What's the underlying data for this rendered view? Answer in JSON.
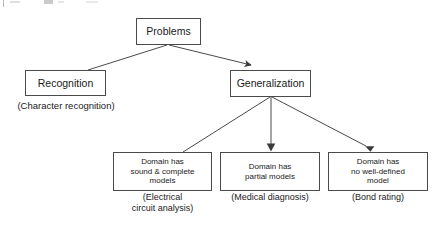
{
  "diagram": {
    "stroke_color": "#4a4a4a",
    "text_color": "#1a1a1a",
    "background_color": "#ffffff",
    "nodes": {
      "problems": {
        "label": "Problems"
      },
      "recognition": {
        "label": "Recognition"
      },
      "generalization": {
        "label": "Generalization"
      },
      "sound_complete": {
        "label": "Domain has\nsound & complete\nmodels"
      },
      "partial": {
        "label": "Domain has\npartial models"
      },
      "no_model": {
        "label": "Domain has\nno well-defined\nmodel"
      }
    },
    "captions": {
      "recognition": "(Character recognition)",
      "electrical": "(Electrical\ncircuit analysis)",
      "medical": "(Medical diagnosis)",
      "bond": "(Bond rating)"
    },
    "edges": [
      {
        "name": "problems-to-recognition",
        "from": "problems",
        "to": "recognition",
        "arrowhead": false
      },
      {
        "name": "problems-to-generalization",
        "from": "problems",
        "to": "generalization",
        "arrowhead": true
      },
      {
        "name": "generalization-to-sound-complete",
        "from": "generalization",
        "to": "sound_complete",
        "arrowhead": false
      },
      {
        "name": "generalization-to-partial",
        "from": "generalization",
        "to": "partial",
        "arrowhead": true
      },
      {
        "name": "generalization-to-no-model",
        "from": "generalization",
        "to": "no_model",
        "arrowhead": true
      }
    ]
  }
}
